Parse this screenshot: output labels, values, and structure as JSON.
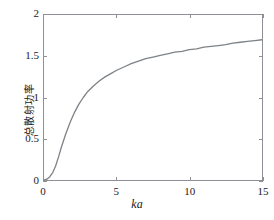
{
  "chart_data": {
    "type": "line",
    "title": "",
    "subtitle": "",
    "xlabel": "ka",
    "ylabel": "总散射功率",
    "xlim": [
      0,
      15
    ],
    "ylim": [
      0,
      2
    ],
    "xticks": [
      "0",
      "5",
      "10",
      "15"
    ],
    "xtick_values": [
      0,
      5,
      10,
      15
    ],
    "yticks": [
      "0",
      "0.5",
      "1",
      "1.5",
      "2"
    ],
    "ytick_values": [
      0,
      0.5,
      1,
      1.5,
      2
    ],
    "grid": false,
    "legend": null,
    "legend_position": "none",
    "annotations": [],
    "series": [
      {
        "name": "总散射功率",
        "color": "#7d8287",
        "line_width": 1.3,
        "x": [
          0,
          0.2,
          0.4,
          0.6,
          0.8,
          1.0,
          1.2,
          1.5,
          1.8,
          2.1,
          2.4,
          2.7,
          3.0,
          3.4,
          3.8,
          4.2,
          4.6,
          5.0,
          5.5,
          6.0,
          6.5,
          7.0,
          7.5,
          8.0,
          8.5,
          9.0,
          9.5,
          10.0,
          10.5,
          11.0,
          11.5,
          12.0,
          12.5,
          13.0,
          13.5,
          14.0,
          14.5,
          15.0
        ],
        "values": [
          0.0,
          0.01,
          0.04,
          0.09,
          0.17,
          0.28,
          0.4,
          0.56,
          0.7,
          0.82,
          0.92,
          1.0,
          1.07,
          1.14,
          1.2,
          1.25,
          1.29,
          1.33,
          1.37,
          1.41,
          1.44,
          1.47,
          1.49,
          1.51,
          1.53,
          1.55,
          1.56,
          1.58,
          1.59,
          1.61,
          1.62,
          1.63,
          1.64,
          1.66,
          1.67,
          1.68,
          1.69,
          1.7
        ]
      }
    ]
  },
  "axes": {
    "box_color": "#8d9196",
    "background": "#ffffff"
  }
}
